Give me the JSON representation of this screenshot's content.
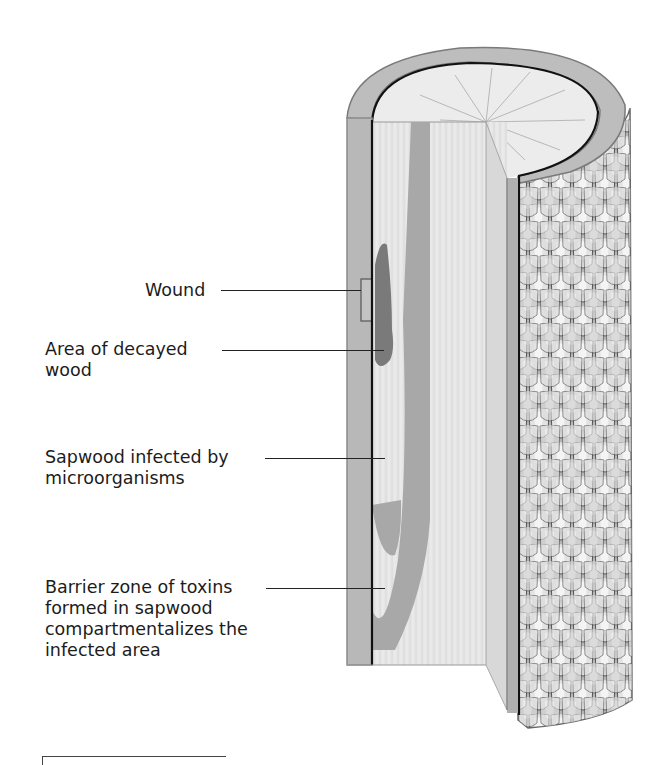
{
  "diagram": {
    "labels": [
      {
        "id": "wound",
        "text": "Wound"
      },
      {
        "id": "decayed",
        "text": "Area of decayed\nwood"
      },
      {
        "id": "sapwood",
        "text": "Sapwood infected by\nmicroorganisms"
      },
      {
        "id": "barrier",
        "text": "Barrier zone of toxins\nformed in sapwood\ncompartmentalizes the\ninfected area"
      }
    ],
    "parts": [
      "bark",
      "cambium",
      "sapwood",
      "decayed-area",
      "infected-band",
      "wound",
      "cross-section-top"
    ],
    "colors": {
      "bark_outer": "#8e8e8e",
      "bark_strip": "#b9b9b9",
      "wood_face": "#e4e4e4",
      "infected_band": "#a9a9a9",
      "decay": "#7d7d7d",
      "cambium_line": "#111111",
      "top_surface": "#ececec"
    }
  }
}
